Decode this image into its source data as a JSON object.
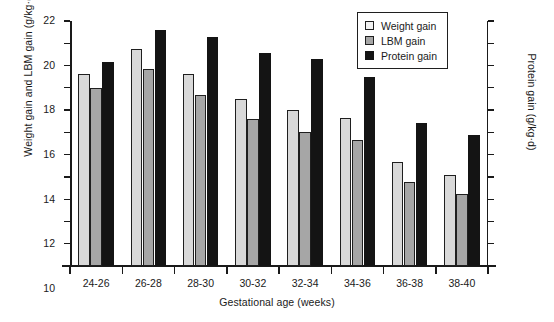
{
  "chart_data": {
    "type": "bar",
    "title": "",
    "xlabel": "Gestational age (weeks)",
    "ylabel": "Weight gain and LBM gain (g/kg·d)",
    "ylabel_right": "Protein gain (g/kg·d)",
    "categories": [
      "24-26",
      "26-28",
      "28-30",
      "30-32",
      "32-34",
      "34-36",
      "36-38",
      "38-40"
    ],
    "ylim": [
      0,
      22
    ],
    "yticks": [
      0,
      2,
      4,
      6,
      8,
      10,
      12,
      14,
      16,
      18,
      20,
      22
    ],
    "ylim_right": [
      0.0,
      2.2
    ],
    "yticks_right": [
      "0.0",
      "0.2",
      "0.4",
      "0.6",
      "0.8",
      "1.0",
      "1.2",
      "1.4",
      "1.6",
      "1.8",
      "2.0",
      "2.2"
    ],
    "grid": false,
    "legend_position": "top-right",
    "series": [
      {
        "name": "Weight gain",
        "axis": "left",
        "color": "#d9d9d9",
        "values": [
          17.2,
          19.5,
          17.2,
          15.0,
          14.0,
          13.3,
          9.3,
          8.2
        ]
      },
      {
        "name": "LBM gain",
        "axis": "left",
        "color": "#a6a6a6",
        "values": [
          16.0,
          17.7,
          15.4,
          13.2,
          12.0,
          11.3,
          7.5,
          6.5
        ]
      },
      {
        "name": "Protein gain",
        "axis": "right",
        "color": "#141414",
        "values": [
          1.83,
          2.12,
          2.06,
          1.91,
          1.86,
          1.7,
          1.28,
          1.18
        ]
      }
    ]
  },
  "legend": {
    "items": [
      {
        "label": "Weight gain"
      },
      {
        "label": "LBM gain"
      },
      {
        "label": "Protein gain"
      }
    ]
  }
}
